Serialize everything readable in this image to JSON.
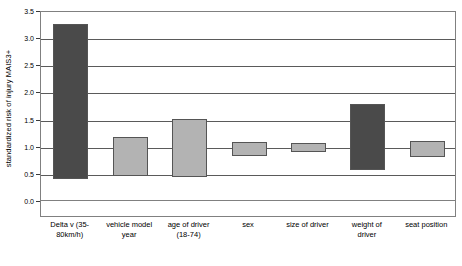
{
  "chart_data": {
    "type": "bar",
    "subtype": "floating-range-bar",
    "title": "",
    "xlabel": "",
    "ylabel": "standardized risk of injury MAIS3+",
    "ylim": [
      0.0,
      3.5
    ],
    "yticks": [
      "0.0",
      "0.5",
      "1.0",
      "1.5",
      "2.0",
      "2.5",
      "3.0",
      "3.5"
    ],
    "ytick_values": [
      0.0,
      0.5,
      1.0,
      1.5,
      2.0,
      2.5,
      3.0,
      3.5
    ],
    "grid": true,
    "legend": "none",
    "categories": [
      "Delta v (35-80km/h)",
      "vehicle model year",
      "age of driver (18-74)",
      "sex",
      "size of driver",
      "weight of driver",
      "seat position"
    ],
    "low_values": [
      0.42,
      0.49,
      0.45,
      0.86,
      0.92,
      0.6,
      0.84
    ],
    "high_values": [
      3.27,
      1.2,
      1.52,
      1.11,
      1.08,
      1.81,
      1.13
    ],
    "bar_colors": [
      "#4a4a4a",
      "#b3b3b3",
      "#b3b3b3",
      "#b3b3b3",
      "#b3b3b3",
      "#4a4a4a",
      "#b3b3b3"
    ],
    "colors": {
      "dark_bar": "#4a4a4a",
      "light_bar": "#b3b3b3",
      "gridline": "#5a5a5a",
      "axis": "#3a3a3a",
      "frame": "#808080",
      "background": "#ffffff",
      "text": "#000000"
    }
  },
  "x_axis_label_lines": [
    [
      "Delta v (35-",
      "80km/h)"
    ],
    [
      "vehicle model",
      "year"
    ],
    [
      "age of driver",
      "(18-74)"
    ],
    [
      "sex"
    ],
    [
      "size of driver"
    ],
    [
      "weight of",
      "driver"
    ],
    [
      "seat position"
    ]
  ]
}
